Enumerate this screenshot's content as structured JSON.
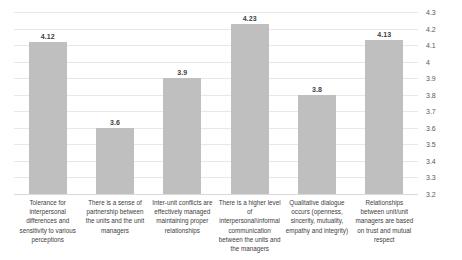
{
  "chart_data": {
    "type": "bar",
    "title": "",
    "xlabel": "",
    "ylabel": "",
    "ylim": [
      3.2,
      4.3
    ],
    "ytick_step": 0.1,
    "yticks": [
      "4.3",
      "4.2",
      "4.1",
      "4",
      "3.9",
      "3.8",
      "3.7",
      "3.6",
      "3.5",
      "3.4",
      "3.3",
      "3.2"
    ],
    "axis_position": "right",
    "grid": true,
    "legend": "none",
    "bar_color": "#bfbfbf",
    "categories": [
      "Tolerance for interpersonal differences and sensitivity to various perceptions",
      "There is a sense of partnership between the units and the unit managers",
      "Inter-unit conflicts are effectively managed maintaining proper relationships",
      "There is a higher level of interpersonal\\informal communication between the units and the managers",
      "Qualitative dialogue occurs (openness, sincerity, mutuality, empathy and integrity)",
      "Relationships between unit/unit managers are based on trust and mutual respect"
    ],
    "values": [
      4.12,
      3.6,
      3.9,
      4.23,
      3.8,
      4.13
    ],
    "value_labels": [
      "4.12",
      "3.6",
      "3.9",
      "4.23",
      "3.8",
      "4.13"
    ]
  }
}
